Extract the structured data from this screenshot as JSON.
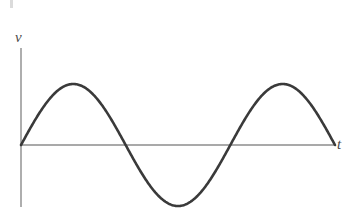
{
  "figure": {
    "background_color": "#ffffff",
    "width": 349,
    "height": 210,
    "axis_color": "#8c8c8c",
    "curve_color": "#3a3a3a",
    "label_color": "#4a4a4a"
  },
  "labels": {
    "y_axis": "v",
    "x_axis": "t"
  },
  "chart_data": {
    "type": "line",
    "title": "",
    "subtitle": "",
    "xlabel": "t",
    "ylabel": "v",
    "grid": false,
    "legend": null,
    "axes": {
      "x_axis_pixel_y": 145,
      "y_axis_pixel_x": 21,
      "x_axis_start_px": 21,
      "x_axis_end_px": 335,
      "y_axis_top_px": 48,
      "y_axis_bottom_px": 207,
      "x_tick_labels": [],
      "y_tick_labels": [],
      "xlim": [
        0,
        1
      ],
      "ylim": [
        -1,
        1
      ]
    },
    "series": [
      {
        "name": "v(t)",
        "description": "one full sinusoidal cycle starting at the origin, rising first",
        "form": "v = A sin(2*pi*t)",
        "amplitude": 1,
        "cycles": 1,
        "phase": 0,
        "x": [
          0.0,
          0.05,
          0.1,
          0.15,
          0.18,
          0.25,
          0.3,
          0.35,
          0.4,
          0.45,
          0.5,
          0.55,
          0.6,
          0.65,
          0.7,
          0.75,
          0.8,
          0.85,
          0.9,
          0.95,
          1.0
        ],
        "y": [
          0.0,
          0.31,
          0.59,
          0.81,
          0.89,
          1.0,
          0.95,
          0.81,
          0.59,
          0.31,
          0.0,
          -0.31,
          -0.59,
          -0.81,
          -0.95,
          -1.0,
          -0.95,
          -0.81,
          -0.59,
          -0.31,
          0.0
        ],
        "key_points": [
          {
            "name": "origin",
            "px": [
              21,
              145
            ],
            "value": [
              0.0,
              0.0
            ]
          },
          {
            "name": "first-peak",
            "px": [
              78,
              84
            ],
            "value": [
              0.25,
              1.0
            ]
          },
          {
            "name": "zero-crossing-descending",
            "px": [
              128,
              145
            ],
            "value": [
              0.5,
              0.0
            ]
          },
          {
            "name": "trough",
            "px": [
              183,
              197
            ],
            "value": [
              0.75,
              -1.0
            ]
          },
          {
            "name": "zero-crossing-ascending",
            "px": [
              232,
              145
            ],
            "value": [
              1.0,
              0.0
            ]
          },
          {
            "name": "second-peak",
            "px": [
              283,
              84
            ],
            "value": [
              1.25,
              1.0
            ]
          },
          {
            "name": "end",
            "px": [
              335,
              145
            ],
            "value": [
              1.5,
              0.0
            ]
          }
        ]
      }
    ],
    "annotations": []
  }
}
